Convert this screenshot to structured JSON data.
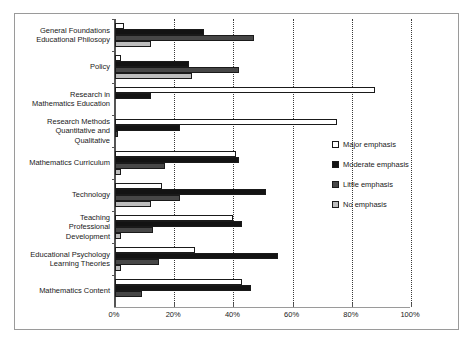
{
  "chart_data": {
    "type": "bar",
    "orientation": "horizontal",
    "title": "",
    "subtitle": "",
    "xlabel": "",
    "ylabel": "",
    "xlim": [
      0,
      100
    ],
    "xticks": [
      "0%",
      "20%",
      "40%",
      "60%",
      "80%",
      "100%"
    ],
    "xtick_values": [
      0,
      20,
      40,
      60,
      80,
      100
    ],
    "grid": "vertical-dotted",
    "legend_position": "right",
    "categories": [
      "General Foundations\nEducational Philosopy",
      "Policy",
      "Research in\nMathematics Education",
      "Research Methods\nQuantitative and\nQualitative",
      "Mathematics Curriculum",
      "Technology",
      "Teaching\nProfessional\nDevelopment",
      "Educational Psychology\nLearning Theories",
      "Mathematics Content"
    ],
    "series": [
      {
        "name": "Major emphasis",
        "color": "#ffffff",
        "values": [
          3,
          2,
          88,
          75,
          41,
          16,
          40,
          27,
          43
        ]
      },
      {
        "name": "Moderate emphasis",
        "color": "#131313",
        "values": [
          30,
          25,
          12,
          22,
          42,
          51,
          43,
          55,
          46
        ]
      },
      {
        "name": "Little emphasis",
        "color": "#474747",
        "values": [
          47,
          42,
          0,
          1,
          17,
          22,
          13,
          15,
          9
        ]
      },
      {
        "name": "No emphasis",
        "color": "#bdbdbd",
        "values": [
          12,
          26,
          0,
          0,
          2,
          12,
          2,
          2,
          0
        ]
      }
    ]
  },
  "legend": {
    "items": [
      {
        "label": "Major emphasis",
        "swatch": "major"
      },
      {
        "label": "Moderate emphasis",
        "swatch": "moderate"
      },
      {
        "label": "Little emphasis",
        "swatch": "little"
      },
      {
        "label": "No emphasis",
        "swatch": "no"
      }
    ]
  }
}
